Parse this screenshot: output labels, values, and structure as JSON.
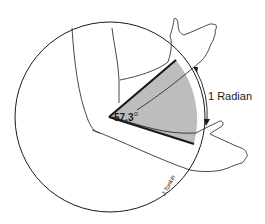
{
  "diagram": {
    "angle_label": "57.3",
    "degree_symbol": "o",
    "arc_label": "1 Radian",
    "signature": "J.Tonkin",
    "colors": {
      "line": "#1a1a1a",
      "wedge_fill": "#bdbdbd",
      "background": "#ffffff"
    }
  }
}
